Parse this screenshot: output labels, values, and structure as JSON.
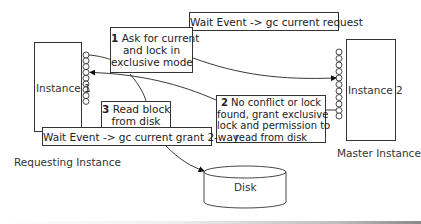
{
  "diagram": {
    "title": "",
    "nodes": {
      "instance1": {
        "label": "Instance 1",
        "caption": "Requesting Instance"
      },
      "instance2": {
        "label": "Instance 2",
        "caption": "Master Instance"
      },
      "disk": {
        "label": "Disk"
      }
    },
    "steps": [
      {
        "number": "1",
        "text_lines": [
          "Ask for current",
          "and lock in",
          "exclusive mode"
        ]
      },
      {
        "number": "2",
        "text_lines": [
          "No conflict or lock",
          "found, grant exclusive",
          "lock and permission to",
          "read from disk"
        ]
      },
      {
        "number": "3",
        "text_lines": [
          "Read block",
          "from disk"
        ]
      }
    ],
    "wait_events": {
      "request": "Wait Event -> gc current request",
      "grant": "Wait Event -> gc current grant 2-way"
    },
    "edges": [
      {
        "from": "instance1",
        "to": "instance2",
        "label_ref": "steps.0"
      },
      {
        "from": "instance2",
        "to": "instance1",
        "label_ref": "steps.1"
      },
      {
        "from": "instance1",
        "to": "disk",
        "label_ref": "steps.2"
      }
    ]
  }
}
